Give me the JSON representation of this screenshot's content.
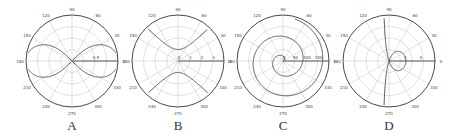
{
  "figure": {
    "panels": [
      {
        "id": "A",
        "label": "A",
        "cx": 72,
        "curve": "lemniscate",
        "radial_ticks": [
          "0.5"
        ],
        "rmax": 1.0,
        "curve_description": "r^2 = cos(2θ) (lemniscate of Bernoulli)"
      },
      {
        "id": "B",
        "label": "B",
        "cx": 178,
        "curve": "hyperbola",
        "radial_ticks": [
          "0",
          "1",
          "2",
          "3"
        ],
        "rmax": 4.0,
        "curve_description": "r^2 = -1/cos(2θ) (rectangular hyperbola, vertical branches)"
      },
      {
        "id": "C",
        "label": "C",
        "cx": 283,
        "curve": "archimedean-spiral",
        "radial_ticks": [
          "0",
          "50",
          "100",
          "150"
        ],
        "rmax": 200,
        "curve_description": "r = k·θ (Archimedean spiral, ~2 turns)"
      },
      {
        "id": "D",
        "label": "D",
        "cx": 389,
        "curve": "conchoid",
        "radial_ticks": [
          "2",
          "4"
        ],
        "rmax": 6,
        "curve_description": "r = 1/cos(θ)·(-1) + b (conchoid with loop)"
      }
    ],
    "angle_ticks": [
      "0",
      "30",
      "60",
      "90",
      "120",
      "150",
      "180",
      "210",
      "240",
      "270",
      "300",
      "330"
    ],
    "colors": {
      "curve": "#555555",
      "axis": "#333333",
      "grid": "#cccccc",
      "text": "#333333"
    }
  }
}
